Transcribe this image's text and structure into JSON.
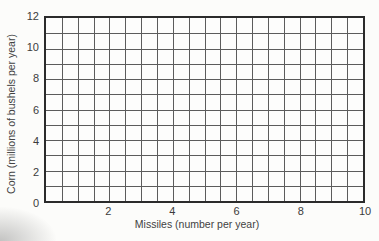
{
  "chart_data": {
    "type": "line",
    "title": "",
    "xlabel": "Missiles (number per year)",
    "ylabel": "Corn (millions of bushels per year)",
    "xlim": [
      0,
      10
    ],
    "ylim": [
      0,
      12
    ],
    "x_tick_labels": [
      "2",
      "4",
      "6",
      "8",
      "10"
    ],
    "x_tick_values": [
      2,
      4,
      6,
      8,
      10
    ],
    "y_tick_labels": [
      "0",
      "2",
      "4",
      "6",
      "8",
      "10",
      "12"
    ],
    "y_tick_values": [
      0,
      2,
      4,
      6,
      8,
      10,
      12
    ],
    "x_minor_step": 0.5,
    "y_minor_step": 1,
    "grid": true,
    "legend": false,
    "series": []
  },
  "colors": {
    "background": "#fcfcfa",
    "plot_border": "#2b2b2b",
    "grid_line": "#5c5c5c",
    "text": "#3d3d3d"
  }
}
